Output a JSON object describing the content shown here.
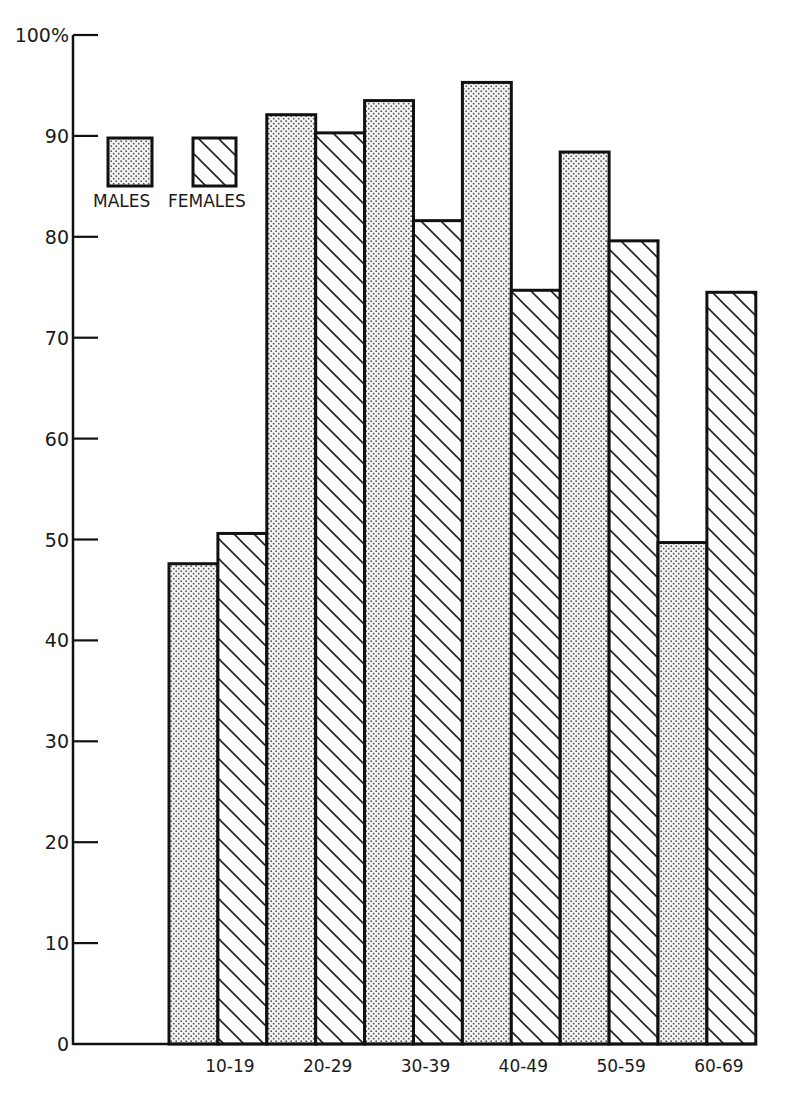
{
  "chart_data": {
    "type": "bar",
    "title": "",
    "xlabel": "",
    "ylabel": "",
    "y_top_label": "100%",
    "categories": [
      "10-19",
      "20-29",
      "30-39",
      "40-49",
      "50-59",
      "60-69"
    ],
    "series": [
      {
        "name": "MALES",
        "pattern": "dots",
        "values": [
          47.6,
          92.1,
          93.5,
          95.3,
          88.4,
          49.7
        ]
      },
      {
        "name": "FEMALES",
        "pattern": "diagonal-hatch",
        "values": [
          50.6,
          90.3,
          81.6,
          74.7,
          79.6,
          74.5
        ]
      }
    ],
    "yticks": [
      0,
      10,
      20,
      30,
      40,
      50,
      60,
      70,
      80,
      90,
      100
    ],
    "ytick_labels": [
      "0",
      "10",
      "20",
      "30",
      "40",
      "50",
      "60",
      "70",
      "80",
      "90",
      "100%"
    ],
    "ylim": [
      0,
      100
    ],
    "grid": false,
    "legend_position": "upper-left",
    "colors": {
      "ink": "#111111",
      "background": "#ffffff",
      "dot": "#555555"
    }
  },
  "legend": {
    "males_label": "MALES",
    "females_label": "FEMALES"
  }
}
